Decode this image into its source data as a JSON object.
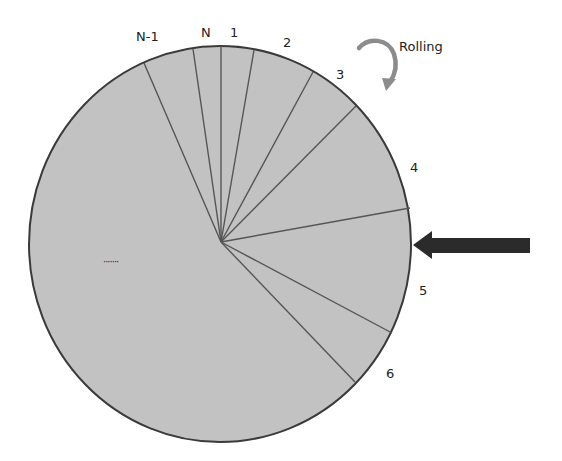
{
  "diagram": {
    "type": "rolling-wheel-segments",
    "wheel": {
      "fill_color": "#c2c2c2",
      "stroke_color": "#3a3a3a",
      "divider_color": "#555555",
      "ellipsis_label": "·······"
    },
    "segment_labels": [
      {
        "id": "n-minus-1",
        "text": "N-1"
      },
      {
        "id": "n",
        "text": "N"
      },
      {
        "id": "1",
        "text": "1"
      },
      {
        "id": "2",
        "text": "2"
      },
      {
        "id": "3",
        "text": "3"
      },
      {
        "id": "4",
        "text": "4"
      },
      {
        "id": "5",
        "text": "5"
      },
      {
        "id": "6",
        "text": "6"
      }
    ],
    "rotation": {
      "label": "Rolling",
      "arrow_color": "#8c8c8c"
    },
    "contact_pointer": {
      "color": "#2b2b2b",
      "direction": "left"
    }
  }
}
